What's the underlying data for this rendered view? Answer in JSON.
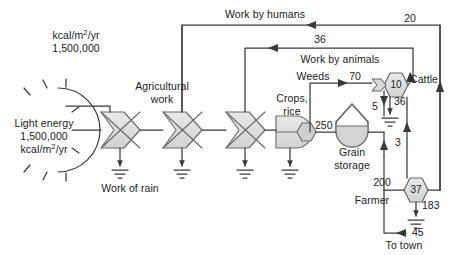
{
  "diagram": {
    "type": "odum-energy-systems-language",
    "units_note": {
      "line1": "kcal/m",
      "line1_sup": "2",
      "line1_tail": "/yr",
      "line2": "1,500,000"
    },
    "source": {
      "name": "Light energy",
      "label_line1": "Light energy",
      "label_line2": "1,500,000",
      "label_line3_head": "kcal/m",
      "label_line3_sup": "2",
      "label_line3_tail": "/yr"
    },
    "labels": {
      "work_by_humans": "Work by humans",
      "work_by_animals": "Work by animals",
      "agricultural_work": "Agricultural work",
      "agricultural_work_l1": "Agricultural",
      "agricultural_work_l2": "work",
      "work_of_rain": "Work of rain",
      "weeds": "Weeds",
      "crops_rice_l1": "Crops,",
      "crops_rice_l2": "rice",
      "grain_storage_l1": "Grain",
      "grain_storage_l2": "storage",
      "cattle": "Cattle",
      "farmer": "Farmer",
      "to_town": "To town"
    },
    "flows": [
      {
        "name": "work-by-humans-return",
        "value": "20",
        "from": "farmer",
        "to": "agricultural-work"
      },
      {
        "name": "work-by-animals-return",
        "value": "36",
        "from": "cattle",
        "to": "agricultural-work"
      },
      {
        "name": "weeds-to-cattle",
        "value": "70",
        "from": "weeds",
        "to": "cattle"
      },
      {
        "name": "crops-to-grain-storage",
        "value": "250",
        "from": "crops-rice",
        "to": "grain-storage"
      },
      {
        "name": "grain-to-cattle",
        "value": "5",
        "from": "grain-storage",
        "to": "cattle"
      },
      {
        "name": "grain-to-farmer",
        "value": "200",
        "from": "grain-storage",
        "to": "farmer"
      },
      {
        "name": "cattle-to-farmer",
        "value": "3",
        "from": "cattle",
        "to": "farmer"
      },
      {
        "name": "farmer-to-town",
        "value": "45",
        "from": "farmer",
        "to": "to-town"
      }
    ],
    "storages": [
      {
        "name": "cattle",
        "value": "10",
        "heat_sink": "36"
      },
      {
        "name": "farmer",
        "value": "37",
        "heat_sink": "183"
      }
    ],
    "colors": {
      "line": "#3a3a3a",
      "fill_gray": "#d8d8d8",
      "fill_light": "#e6e6e6",
      "text": "#1a1a1a",
      "background": "#ffffff"
    }
  }
}
